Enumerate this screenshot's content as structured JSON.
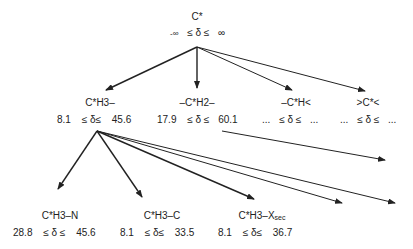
{
  "root": {
    "label": "C*",
    "lower": "-∞",
    "rel": "≤ δ ≤",
    "upper": "∞"
  },
  "level1": [
    {
      "label": "C*H3–",
      "lower": "8.1",
      "rel": "≤ δ≤",
      "upper": "45.6"
    },
    {
      "label": "–C*H2–",
      "lower": "17.9",
      "rel": "≤ δ ≤",
      "upper": "60.1"
    },
    {
      "label": "–C*H<",
      "lower": "...",
      "rel": "≤ δ ≤",
      "upper": "..."
    },
    {
      "label": ">C*<",
      "lower": "...",
      "rel": "≤ δ ≤",
      "upper": "..."
    }
  ],
  "level2": [
    {
      "label": "C*H3–N",
      "lower": "28.8",
      "rel": "≤ δ ≤",
      "upper": "45.6"
    },
    {
      "label": "C*H3–C",
      "lower": "8.1",
      "rel": "≤ δ≤",
      "upper": "33.5"
    },
    {
      "label": "C*H3–X",
      "label_sub": "sec",
      "lower": "8.1",
      "rel": "≤ δ≤",
      "upper": "36.7"
    }
  ],
  "colors": {
    "line": "#222222",
    "text": "#222222"
  }
}
